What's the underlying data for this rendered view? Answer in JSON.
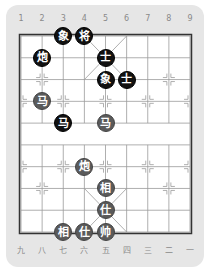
{
  "board": {
    "top_labels": [
      "1",
      "2",
      "3",
      "4",
      "5",
      "6",
      "7",
      "8",
      "9"
    ],
    "bottom_labels": [
      "九",
      "八",
      "七",
      "六",
      "五",
      "四",
      "三",
      "二",
      "一"
    ],
    "colors": {
      "panel": "#e6e6e6",
      "board": "#ffffff",
      "line": "#9a9a9a",
      "border": "#333333",
      "black_piece": "#111111",
      "red_piece": "#5a5a5a"
    }
  },
  "pieces": [
    {
      "side": "black",
      "char": "象",
      "name": "black-elephant",
      "col": 3,
      "row": 0
    },
    {
      "side": "black",
      "char": "将",
      "name": "black-general",
      "col": 4,
      "row": 0
    },
    {
      "side": "black",
      "char": "炮",
      "name": "black-cannon",
      "col": 2,
      "row": 1
    },
    {
      "side": "black",
      "char": "士",
      "name": "black-advisor",
      "col": 5,
      "row": 1
    },
    {
      "side": "black",
      "char": "象",
      "name": "black-elephant",
      "col": 5,
      "row": 2
    },
    {
      "side": "black",
      "char": "士",
      "name": "black-advisor",
      "col": 6,
      "row": 2
    },
    {
      "side": "red",
      "char": "马",
      "name": "red-horse",
      "col": 2,
      "row": 3
    },
    {
      "side": "black",
      "char": "马",
      "name": "black-horse",
      "col": 3,
      "row": 4
    },
    {
      "side": "red",
      "char": "马",
      "name": "red-horse",
      "col": 5,
      "row": 4
    },
    {
      "side": "red",
      "char": "炮",
      "name": "red-cannon",
      "col": 4,
      "row": 6
    },
    {
      "side": "red",
      "char": "相",
      "name": "red-elephant",
      "col": 5,
      "row": 7
    },
    {
      "side": "red",
      "char": "仕",
      "name": "red-advisor",
      "col": 5,
      "row": 8
    },
    {
      "side": "red",
      "char": "相",
      "name": "red-elephant",
      "col": 3,
      "row": 9
    },
    {
      "side": "red",
      "char": "仕",
      "name": "red-advisor",
      "col": 4,
      "row": 9
    },
    {
      "side": "red",
      "char": "帅",
      "name": "red-king",
      "col": 5,
      "row": 9
    }
  ]
}
